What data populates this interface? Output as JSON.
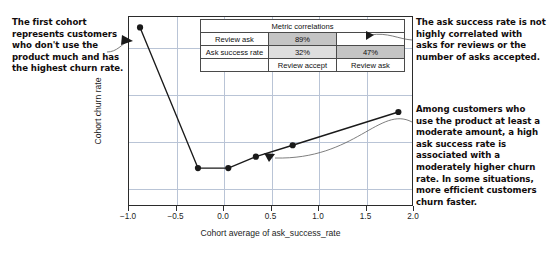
{
  "annotations": {
    "left": "The first cohort represents customers who don't use the product much and has the highest churn rate.",
    "right_top": "The ask success rate is not highly correlated with asks for reviews or the number of asks accepted.",
    "right_bottom": "Among customers who use the product at least a moderate amount, a high ask success rate is associated with a moderately higher churn rate. In some situations, more efficient customers churn faster."
  },
  "metric_table": {
    "title": "Metric correlations",
    "rows": [
      {
        "label": "Review ask",
        "review_accept": "89%",
        "review_ask": ""
      },
      {
        "label": "Ask success rate",
        "review_accept": "32%",
        "review_ask": "47%"
      },
      {
        "label": "",
        "review_accept": "Review accept",
        "review_ask": "Review ask"
      }
    ]
  },
  "chart_data": {
    "type": "line",
    "title": "",
    "xlabel": "Cohort average of ask_success_rate",
    "ylabel": "Cohort churn rate",
    "xlim": [
      -1.05,
      2.05
    ],
    "ylim": [
      0,
      1
    ],
    "xticks": [
      -1.0,
      -0.5,
      0.0,
      0.5,
      1.0,
      1.5,
      2.0
    ],
    "xticklabels": [
      "−1.0",
      "−0.5",
      "0.0",
      "0.5",
      "1.0",
      "1.5",
      "2.0"
    ],
    "yticks": [],
    "yticklabels": [],
    "grid": true,
    "legend": false,
    "series": [
      {
        "name": "Cohort churn rate",
        "marker": "circle",
        "color": "#1a1a1a",
        "x": [
          -0.93,
          -0.3,
          0.03,
          0.33,
          0.73,
          1.88
        ],
        "y": [
          0.945,
          0.205,
          0.205,
          0.265,
          0.325,
          0.5
        ]
      }
    ]
  },
  "colors": {
    "line": "#1a1a1a",
    "marker": "#1a1a1a",
    "grid": "#b9c4d6",
    "frame": "#2b2b2b",
    "table_highlight_dark": "#c4c4c4",
    "table_highlight_light": "#dedede",
    "text": "#120c0c"
  }
}
